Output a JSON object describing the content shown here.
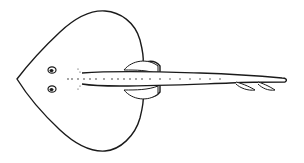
{
  "image": {
    "subject": "line drawing of a skate (dorsal view)",
    "background": "#ffffff",
    "stroke": "#1a1a1a"
  }
}
